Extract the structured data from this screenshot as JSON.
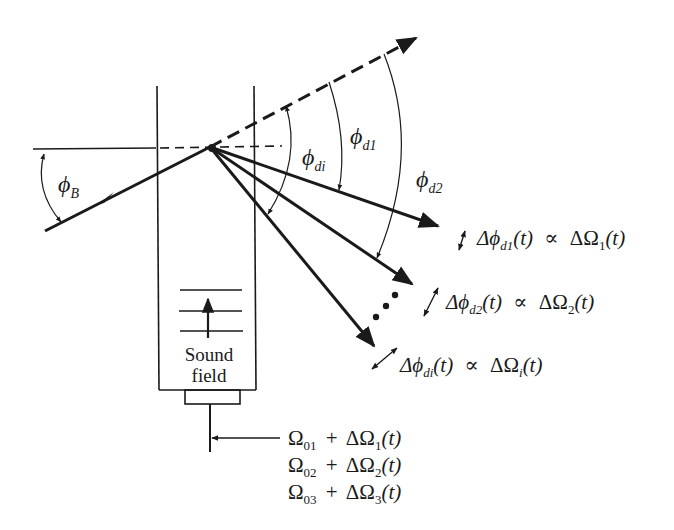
{
  "diagram": {
    "labels": {
      "phi": "ϕ",
      "bragg_sub": "B",
      "di_sub": "di",
      "d1_sub": "d1",
      "d2_sub": "d2",
      "sound_line1": "Sound",
      "sound_line2": "field"
    },
    "deflection_relations": [
      {
        "delta_phi": "Δϕ",
        "sub": "d1",
        "t": "(t)",
        "prop": "∝",
        "delta_omega": "ΔΩ",
        "osub": "1",
        "ot": "(t)"
      },
      {
        "delta_phi": "Δϕ",
        "sub": "d2",
        "t": "(t)",
        "prop": "∝",
        "delta_omega": "ΔΩ",
        "osub": "2",
        "ot": "(t)"
      },
      {
        "delta_phi": "Δϕ",
        "sub": "di",
        "t": "(t)",
        "prop": "∝",
        "delta_omega": "ΔΩ",
        "osub": "i",
        "ot": "(t)"
      }
    ],
    "drive_frequencies": [
      {
        "omega": "Ω",
        "sub": "01",
        "plus": "+",
        "delta_omega": "ΔΩ",
        "dsub": "1",
        "t": "(t)"
      },
      {
        "omega": "Ω",
        "sub": "02",
        "plus": "+",
        "delta_omega": "ΔΩ",
        "dsub": "2",
        "t": "(t)"
      },
      {
        "omega": "Ω",
        "sub": "03",
        "plus": "+",
        "delta_omega": "ΔΩ",
        "dsub": "3",
        "t": "(t)"
      }
    ],
    "ellipsis": "• • •",
    "colors": {
      "ink": "#1a1a1a",
      "background": "#ffffff"
    }
  }
}
